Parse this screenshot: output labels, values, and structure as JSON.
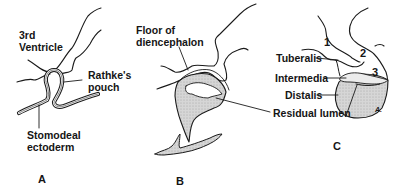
{
  "figure": {
    "panels": [
      {
        "id": "A",
        "letter": "A",
        "labels": {
          "third_ventricle_1": "3rd",
          "third_ventricle_2": "Ventricle",
          "rathkes_pouch_1": "Rathke's",
          "rathkes_pouch_2": "pouch",
          "stomodeal_ectoderm_1": "Stomodeal",
          "stomodeal_ectoderm_2": "ectoderm"
        }
      },
      {
        "id": "B",
        "letter": "B",
        "labels": {
          "floor_1": "Floor of",
          "floor_2": "diencephalon",
          "residual_lumen": "Residual lumen"
        }
      },
      {
        "id": "C",
        "letter": "C",
        "labels": {
          "tuberalis": "Tuberalis",
          "intermedia": "Intermedia",
          "distalis": "Distalis"
        },
        "numbers": [
          "1",
          "2",
          "3"
        ],
        "signature": "A."
      }
    ],
    "colors": {
      "line": "#1a1a1a",
      "tissue_fill": "#d2d2d2",
      "background": "#ffffff"
    }
  }
}
